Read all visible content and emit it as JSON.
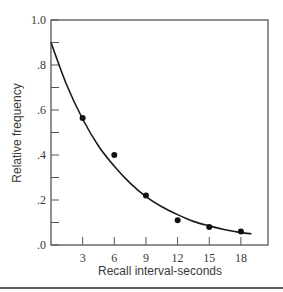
{
  "chart_data": {
    "type": "line",
    "title": "",
    "xlabel": "Recall interval-seconds",
    "ylabel": "Relative frequency",
    "xlim": [
      0,
      20.5
    ],
    "ylim": [
      0,
      1.0
    ],
    "x_ticks": [
      3,
      6,
      9,
      12,
      15,
      18
    ],
    "x_tick_labels": [
      "3",
      "6",
      "9",
      "12",
      "15",
      "18"
    ],
    "y_ticks": [
      0.0,
      0.1,
      0.2,
      0.3,
      0.4,
      0.5,
      0.6,
      0.7,
      0.8,
      0.9,
      1.0
    ],
    "y_tick_labels": [
      ".0",
      ".2",
      ".4",
      ".6",
      ".8",
      "1.0"
    ],
    "y_labeled_ticks": [
      0.0,
      0.2,
      0.4,
      0.6,
      0.8,
      1.0
    ],
    "grid": false,
    "legend": null,
    "series": [
      {
        "name": "observed",
        "kind": "scatter",
        "x": [
          3,
          6,
          9,
          12,
          15,
          18
        ],
        "values": [
          0.565,
          0.4,
          0.22,
          0.11,
          0.08,
          0.06
        ]
      },
      {
        "name": "fitted curve",
        "kind": "line",
        "description": "Smooth decreasing curve starting at .9 at x=0",
        "x": [
          0,
          1.5,
          3,
          4.5,
          6,
          7.5,
          9,
          10.5,
          12,
          13.5,
          15,
          16.5,
          18,
          19
        ],
        "values": [
          0.9,
          0.71,
          0.56,
          0.44,
          0.35,
          0.275,
          0.215,
          0.17,
          0.135,
          0.105,
          0.085,
          0.068,
          0.055,
          0.05
        ]
      }
    ]
  }
}
